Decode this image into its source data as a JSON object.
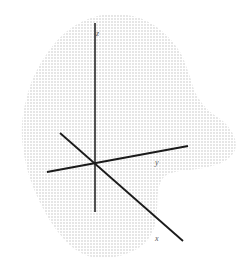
{
  "figure": {
    "background_color": "#ffffff",
    "axis_color": "#1a1a1a",
    "label_color": "#5a5a5a",
    "region_fill_color": "#808080",
    "region_pattern": "stipple-dots"
  },
  "chart_data": {
    "type": "scatter",
    "title": "",
    "subtitle": "",
    "xlabel": "x",
    "ylabel": "y",
    "zlabel": "z",
    "grid": false,
    "legend": null,
    "annotations": [
      {
        "name": "origin",
        "x": 95,
        "y": 163
      }
    ],
    "axes": [
      {
        "name": "z-axis",
        "label": "z",
        "label_position": {
          "x": 96,
          "y": 30
        },
        "start": {
          "x": 95,
          "y": 23
        },
        "end": {
          "x": 95,
          "y": 212
        },
        "orientation": "vertical",
        "direction_positive": "up"
      },
      {
        "name": "y-axis",
        "label": "y",
        "label_position": {
          "x": 155,
          "y": 159
        },
        "start": {
          "x": 47,
          "y": 172
        },
        "end": {
          "x": 188,
          "y": 146
        },
        "orientation": "oblique-right",
        "direction_positive": "right"
      },
      {
        "name": "x-axis",
        "label": "x",
        "label_position": {
          "x": 155,
          "y": 235
        },
        "start": {
          "x": 60,
          "y": 133
        },
        "end": {
          "x": 183,
          "y": 241
        },
        "orientation": "oblique-down-right",
        "direction_positive": "down-right"
      }
    ],
    "region": {
      "name": "shaded-region",
      "fill": "stipple",
      "closed": true,
      "outline_points": [
        [
          112,
          14
        ],
        [
          140,
          18
        ],
        [
          163,
          32
        ],
        [
          180,
          52
        ],
        [
          189,
          74
        ],
        [
          196,
          94
        ],
        [
          208,
          110
        ],
        [
          224,
          122
        ],
        [
          234,
          136
        ],
        [
          235,
          150
        ],
        [
          225,
          161
        ],
        [
          208,
          167
        ],
        [
          190,
          170
        ],
        [
          175,
          172
        ],
        [
          163,
          178
        ],
        [
          158,
          192
        ],
        [
          157,
          210
        ],
        [
          154,
          228
        ],
        [
          144,
          244
        ],
        [
          126,
          254
        ],
        [
          106,
          258
        ],
        [
          88,
          256
        ],
        [
          72,
          247
        ],
        [
          58,
          232
        ],
        [
          46,
          214
        ],
        [
          36,
          194
        ],
        [
          28,
          172
        ],
        [
          23,
          148
        ],
        [
          22,
          124
        ],
        [
          26,
          100
        ],
        [
          34,
          76
        ],
        [
          48,
          52
        ],
        [
          66,
          32
        ],
        [
          88,
          19
        ]
      ]
    }
  },
  "labels": {
    "z": "z",
    "y": "y",
    "x": "x"
  }
}
